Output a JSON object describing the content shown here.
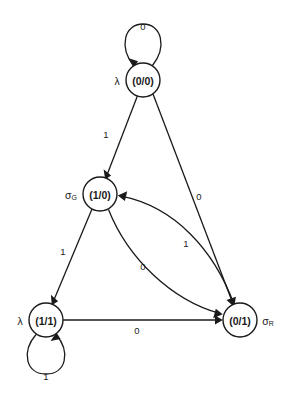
{
  "diagram": {
    "kind": "state-transition-diagram",
    "title": "",
    "background_color": "#ffffff",
    "stroke_color": "#1a1a1a",
    "nodes": [
      {
        "id": "lambda-00",
        "state_name": "λ",
        "state_subscript": "",
        "output_label": "(0/0)",
        "cx": 143,
        "cy": 80,
        "r": 17,
        "name_x": 117,
        "name_y": 80
      },
      {
        "id": "sigma-g-10",
        "state_name": "σ",
        "state_subscript": "G",
        "output_label": "(1/0)",
        "cx": 100,
        "cy": 194,
        "r": 17,
        "name_x": 71,
        "name_y": 194
      },
      {
        "id": "lambda-11",
        "state_name": "λ",
        "state_subscript": "",
        "output_label": "(1/1)",
        "cx": 46,
        "cy": 320,
        "r": 17,
        "name_x": 20,
        "name_y": 320
      },
      {
        "id": "sigma-r-01",
        "state_name": "σ",
        "state_subscript": "R",
        "output_label": "(0/1)",
        "cx": 240,
        "cy": 320,
        "r": 17,
        "name_x": 268,
        "name_y": 320
      }
    ],
    "transitions": [
      {
        "id": "t-self-top",
        "from": "lambda-00",
        "to": "lambda-00",
        "input": "0",
        "label_x": 143,
        "label_y": 26,
        "kind": "self-loop-top"
      },
      {
        "id": "t-top-to-g",
        "from": "lambda-00",
        "to": "sigma-g-10",
        "input": "1",
        "label_x": 106,
        "label_y": 134,
        "kind": "straight"
      },
      {
        "id": "t-top-to-r",
        "from": "lambda-00",
        "to": "sigma-r-01",
        "input": "0",
        "label_x": 199,
        "label_y": 196,
        "kind": "straight"
      },
      {
        "id": "t-r-to-g",
        "from": "sigma-r-01",
        "to": "sigma-g-10",
        "input": "1",
        "label_x": 186,
        "label_y": 243,
        "kind": "curve"
      },
      {
        "id": "t-g-to-r",
        "from": "sigma-g-10",
        "to": "sigma-r-01",
        "input": "0",
        "label_x": 143,
        "label_y": 266,
        "kind": "curve"
      },
      {
        "id": "t-g-to-lambda11",
        "from": "sigma-g-10",
        "to": "lambda-11",
        "input": "1",
        "label_x": 63,
        "label_y": 251,
        "kind": "straight"
      },
      {
        "id": "t-lambda11-to-r",
        "from": "lambda-11",
        "to": "sigma-r-01",
        "input": "0",
        "label_x": 137,
        "label_y": 330,
        "kind": "straight"
      },
      {
        "id": "t-self-bottom",
        "from": "lambda-11",
        "to": "lambda-11",
        "input": "1",
        "label_x": 46,
        "label_y": 376,
        "kind": "self-loop-bottom"
      }
    ]
  }
}
